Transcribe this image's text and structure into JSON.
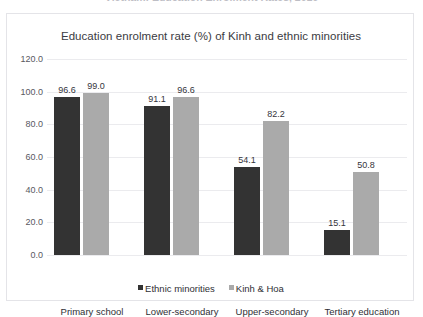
{
  "page": {
    "clipped_heading": "Vietnam: Education Enrolment Rates, 2016"
  },
  "legend": {
    "position": "bottom-center",
    "items": [
      {
        "label": "Ethnic minorities",
        "color": "#333333"
      },
      {
        "label": "Kinh & Hoa",
        "color": "#aaaaaa"
      }
    ]
  },
  "chart_data": {
    "type": "bar",
    "title": "Education enrolment rate (%) of Kinh and ethnic minorities",
    "xlabel": "",
    "ylabel": "",
    "ylim": [
      0,
      120
    ],
    "ytick_labels": [
      "0.0",
      "20.0",
      "40.0",
      "60.0",
      "80.0",
      "100.0",
      "120.0"
    ],
    "ytick_values": [
      0,
      20,
      40,
      60,
      80,
      100,
      120
    ],
    "grid": true,
    "categories": [
      "Primary school",
      "Lower-secondary",
      "Upper-secondary",
      "Tertiary education"
    ],
    "series": [
      {
        "name": "Ethnic minorities",
        "color": "#333333",
        "values": [
          96.6,
          91.1,
          54.1,
          15.1
        ],
        "labels": [
          "96.6",
          "91.1",
          "54.1",
          "15.1"
        ]
      },
      {
        "name": "Kinh & Hoa",
        "color": "#aaaaaa",
        "values": [
          99.0,
          96.6,
          82.2,
          50.8
        ],
        "labels": [
          "99.0",
          "96.6",
          "82.2",
          "50.8"
        ]
      }
    ]
  }
}
